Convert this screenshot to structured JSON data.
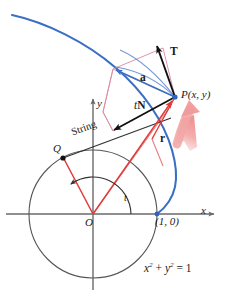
{
  "figure": {
    "labels": {
      "axis_x": "x",
      "axis_y": "y",
      "origin": "O",
      "point_P": "P(x, y)",
      "point_Q": "Q",
      "point_one_zero": "(1, 0)",
      "angle_t": "t",
      "string": "String",
      "vector_r": "r",
      "vector_T": "T",
      "vector_a": "a",
      "vector_tN_prefix": "t",
      "vector_tN_suffix": "N",
      "circle_equation_base_x": "x",
      "circle_equation_exp_x": "2",
      "circle_equation_plus": " + ",
      "circle_equation_base_y": "y",
      "circle_equation_exp_y": "2",
      "circle_equation_rhs": " = 1"
    },
    "colors": {
      "curve_blue": "#3a6fc4",
      "vector_red": "#e03a3a",
      "vector_black": "#111111",
      "axis_gray": "#6a6a6a",
      "circle_gray": "#555555",
      "parallelogram_pink": "#d98aa0",
      "motion_arrow_pink": "#f2a6a6",
      "background": "#ffffff"
    },
    "geometry": {
      "origin": [
        93,
        214
      ],
      "circle_radius": 64,
      "point_P": [
        175,
        97
      ],
      "point_Q": [
        63,
        158
      ],
      "point_one_zero": [
        157,
        214
      ],
      "T_tip": [
        156,
        44
      ],
      "a_tip": [
        113,
        69
      ],
      "tN_tip": [
        113,
        131
      ],
      "parallelogram_top": [
        163,
        48
      ],
      "angle_t_degrees": 125
    }
  }
}
